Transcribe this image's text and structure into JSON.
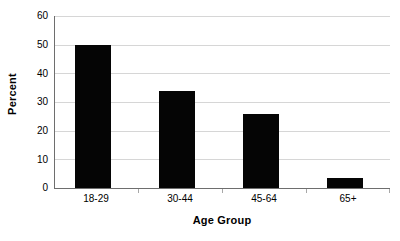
{
  "chart_data": {
    "type": "bar",
    "title": "",
    "categories": [
      "18-29",
      "30-44",
      "45-64",
      "65+"
    ],
    "values": [
      50,
      34,
      26,
      3.5
    ],
    "series": [
      {
        "name": "Percent",
        "values": [
          50,
          34,
          26,
          3.5
        ]
      }
    ],
    "xlabel": "Age Group",
    "ylabel": "Percent",
    "ylim": [
      0,
      60
    ],
    "ytick_labels": [
      "60",
      "50",
      "40",
      "30",
      "20",
      "10",
      "0"
    ],
    "ytick_values": [
      60,
      50,
      40,
      30,
      20,
      10,
      0
    ],
    "ytick_step": 10,
    "grid": true,
    "grid_axis": "y",
    "legend": false,
    "legend_position": "none",
    "bar_color": "#050505",
    "grid_color": "#d6d6d6",
    "axis_color": "#6e6e6e",
    "background_color": "#ffffff",
    "text_color": "#000000"
  }
}
